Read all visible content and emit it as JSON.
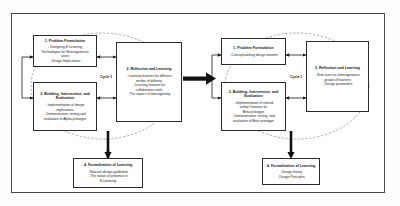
{
  "diagram": {
    "frame_color": "#4a4a4a",
    "box_border_color": "#2b2b2b",
    "arrow_color": "#000000",
    "ellipse_style": "dashed"
  },
  "cycles": [
    {
      "id": "cycle-left",
      "label": "Cycle 1",
      "stages": [
        {
          "id": "problem-formulation-left",
          "title": "1. Problem Formulation",
          "lines": [
            "- Designing E-Learning",
            "Technologies for Heterogeneous",
            "users",
            "- Design Implications"
          ]
        },
        {
          "id": "building-intervention-evaluation-left",
          "title": "3. Building, Intervention, and Evaluation",
          "lines": [
            "- Implementation of design",
            "implications",
            "- Demonstration, testing and",
            "evaluation of Alpha prototype"
          ]
        },
        {
          "id": "reflection-learning-left",
          "title": "2. Reflection and Learning",
          "lines": [
            "- Learning features for different",
            "modes of delivery",
            "- Learning features for",
            "collaborative tools",
            "- The aspect of heterogeneity"
          ]
        },
        {
          "id": "formalization-learning-left",
          "title": "4. Formalization of Learning",
          "lines": [
            "- Nascent design guidelines",
            "- The notion of presence in",
            "E-Learning"
          ]
        }
      ]
    },
    {
      "id": "cycle-right",
      "label": "Cycle 1",
      "stages": [
        {
          "id": "problem-formulation-right",
          "title": "1. Problem Formulation",
          "lines": [
            "- Conceptualizing design maxims"
          ]
        },
        {
          "id": "building-intervention-evaluation-right",
          "title": "3. Building, Intervention, and Evaluation",
          "lines": [
            "- Implementation of refined",
            "artifact features for",
            "Beta prototype",
            "- Demonstration, testing, and",
            "evaluation of Beta prototype"
          ]
        },
        {
          "id": "reflection-learning-right",
          "title": "2. Reflection and Learning",
          "lines": [
            "- End-users as heterogeneous",
            "groups of learners",
            "- Design parameters"
          ]
        },
        {
          "id": "formalization-learning-right",
          "title": "4. Formalization of Learning",
          "lines": [
            "- Design theory",
            "- Design Principles"
          ]
        }
      ]
    }
  ]
}
